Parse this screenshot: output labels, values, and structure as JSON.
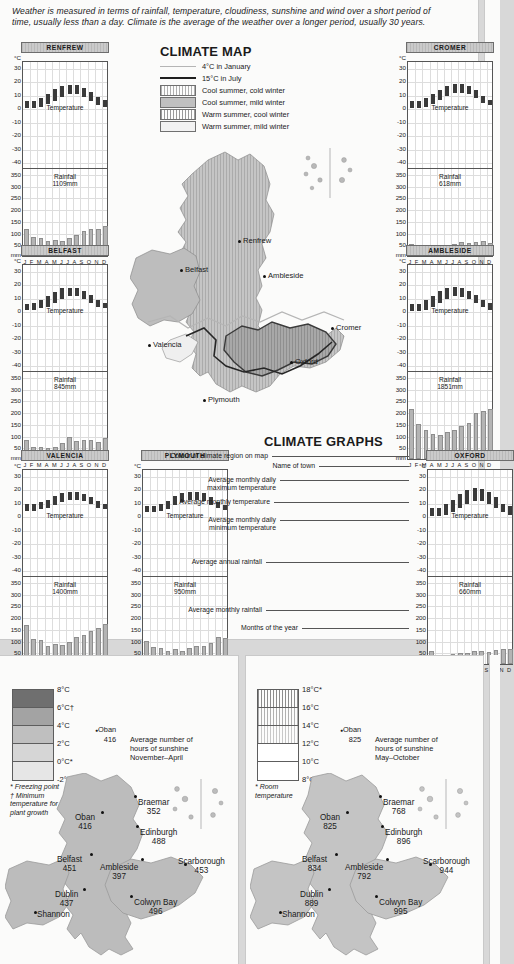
{
  "intro": "Weather is measured in terms of rainfall, temperature, cloudiness, sunshine and wind over a short period of time, usually less than a day. Climate is the average of the weather over a longer period, usually 30 years.",
  "sections": {
    "climate_map": "CLIMATE MAP",
    "climate_graphs": "CLIMATE GRAPHS"
  },
  "key": {
    "lines": [
      {
        "label": "4°C in January",
        "color": "#b5b5b5",
        "weight": 1
      },
      {
        "label": "15°C in July",
        "color": "#1f1f1f",
        "weight": 2
      }
    ],
    "swatches": [
      {
        "label": "Cool summer, cold winter",
        "color": "#b0b0b0",
        "hatch": true
      },
      {
        "label": "Cool summer, mild winter",
        "color": "#c0c0c0",
        "hatch": false
      },
      {
        "label": "Warm summer, cool winter",
        "color": "#9a9a9a",
        "hatch": true
      },
      {
        "label": "Warm summer, mild winter",
        "color": "#f2f2f2",
        "hatch": false
      }
    ]
  },
  "map_cities": [
    {
      "name": "Renfrew",
      "x": 108,
      "y": 98
    },
    {
      "name": "Belfast",
      "x": 50,
      "y": 127
    },
    {
      "name": "Ambleside",
      "x": 133,
      "y": 133
    },
    {
      "name": "Cromer",
      "x": 201,
      "y": 185
    },
    {
      "name": "Valencia",
      "x": 18,
      "y": 202
    },
    {
      "name": "Oxford",
      "x": 160,
      "y": 219
    },
    {
      "name": "Plymouth",
      "x": 73,
      "y": 257
    }
  ],
  "graph_axis": {
    "temp_unit": "°C",
    "temp_ticks": [
      "30",
      "20",
      "10",
      "0",
      "-10",
      "-20",
      "-30",
      "-40"
    ],
    "rain_unit": "mm",
    "rain_ticks": [
      "350",
      "300",
      "250",
      "200",
      "150",
      "100",
      "50"
    ],
    "months": [
      "J",
      "F",
      "M",
      "A",
      "M",
      "J",
      "J",
      "A",
      "S",
      "O",
      "N",
      "D"
    ],
    "temp_caption": "Temperature",
    "rain_caption": "Rainfall"
  },
  "annotations": [
    {
      "text": "Colour of climate region on map",
      "x": 268,
      "y": 452
    },
    {
      "text": "Name of town",
      "x": 315,
      "y": 462
    },
    {
      "text": "Average monthly daily\nmaximum temperature",
      "x": 276,
      "y": 476
    },
    {
      "text": "Average monthly temperature",
      "x": 270,
      "y": 498
    },
    {
      "text": "Average monthly daily\nminimum temperature",
      "x": 276,
      "y": 516
    },
    {
      "text": "Average annual rainfall",
      "x": 262,
      "y": 558
    },
    {
      "text": "Average monthly rainfall",
      "x": 262,
      "y": 606
    },
    {
      "text": "Months of the year",
      "x": 298,
      "y": 624
    }
  ],
  "chart_data": [
    {
      "type": "bar",
      "title": "RENFREW",
      "x": 5,
      "y": 42,
      "categories": [
        "J",
        "F",
        "M",
        "A",
        "M",
        "J",
        "J",
        "A",
        "S",
        "O",
        "N",
        "D"
      ],
      "ylabel": "°C",
      "ylim": [
        -45,
        35
      ],
      "rain_ylim": [
        0,
        375
      ],
      "rain_ylabel": "mm",
      "annual_rainfall_label": "1109mm",
      "annual_rainfall": 1109,
      "temp_min": [
        1,
        1,
        2,
        4,
        6,
        9,
        11,
        11,
        9,
        6,
        3,
        2
      ],
      "temp_max": [
        6,
        6,
        8,
        11,
        15,
        17,
        18,
        18,
        16,
        13,
        9,
        7
      ],
      "rainfall": [
        115,
        80,
        75,
        63,
        68,
        66,
        78,
        90,
        105,
        113,
        117,
        127
      ]
    },
    {
      "type": "bar",
      "title": "CROMER",
      "x": 390,
      "y": 42,
      "categories": [
        "J",
        "F",
        "M",
        "A",
        "M",
        "J",
        "J",
        "A",
        "S",
        "O",
        "N",
        "D"
      ],
      "ylabel": "°C",
      "ylim": [
        -45,
        35
      ],
      "rain_ylim": [
        0,
        375
      ],
      "rain_ylabel": "mm",
      "annual_rainfall_label": "618mm",
      "annual_rainfall": 618,
      "temp_min": [
        1,
        1,
        2,
        4,
        7,
        10,
        12,
        12,
        11,
        8,
        5,
        3
      ],
      "temp_max": [
        6,
        6,
        8,
        11,
        14,
        17,
        19,
        19,
        17,
        14,
        10,
        7
      ],
      "rainfall": [
        52,
        40,
        38,
        39,
        41,
        44,
        52,
        58,
        56,
        58,
        62,
        56
      ]
    },
    {
      "type": "bar",
      "title": "BELFAST",
      "x": 5,
      "y": 245,
      "categories": [
        "J",
        "F",
        "M",
        "A",
        "M",
        "J",
        "J",
        "A",
        "S",
        "O",
        "N",
        "D"
      ],
      "ylabel": "°C",
      "ylim": [
        -45,
        35
      ],
      "rain_ylim": [
        0,
        375
      ],
      "rain_ylabel": "mm",
      "annual_rainfall_label": "845mm",
      "annual_rainfall": 845,
      "temp_min": [
        2,
        2,
        3,
        4,
        7,
        10,
        12,
        12,
        10,
        7,
        4,
        3
      ],
      "temp_max": [
        6,
        7,
        9,
        12,
        15,
        18,
        18,
        18,
        16,
        13,
        9,
        7
      ],
      "rainfall": [
        80,
        52,
        50,
        48,
        52,
        68,
        94,
        77,
        80,
        83,
        72,
        90
      ]
    },
    {
      "type": "bar",
      "title": "AMBLESIDE",
      "x": 390,
      "y": 245,
      "categories": [
        "J",
        "F",
        "M",
        "A",
        "M",
        "J",
        "J",
        "A",
        "S",
        "O",
        "N",
        "D"
      ],
      "ylabel": "°C",
      "ylim": [
        -45,
        35
      ],
      "rain_ylim": [
        0,
        375
      ],
      "rain_ylabel": "mm",
      "annual_rainfall_label": "1851mm",
      "annual_rainfall": 1851,
      "temp_min": [
        1,
        1,
        2,
        4,
        7,
        10,
        12,
        11,
        10,
        7,
        4,
        2
      ],
      "temp_max": [
        6,
        6,
        9,
        12,
        16,
        18,
        19,
        18,
        16,
        13,
        9,
        7
      ],
      "rainfall": [
        215,
        148,
        123,
        105,
        103,
        113,
        125,
        140,
        153,
        196,
        205,
        212
      ]
    },
    {
      "type": "bar",
      "title": "VALENCIA",
      "x": 5,
      "y": 450,
      "categories": [
        "J",
        "F",
        "M",
        "A",
        "M",
        "J",
        "J",
        "A",
        "S",
        "O",
        "N",
        "D"
      ],
      "ylabel": "°C",
      "ylim": [
        -45,
        35
      ],
      "rain_ylim": [
        0,
        375
      ],
      "rain_ylabel": "mm",
      "annual_rainfall_label": "1400mm",
      "annual_rainfall": 1400,
      "temp_min": [
        5,
        5,
        6,
        7,
        9,
        11,
        13,
        13,
        12,
        10,
        7,
        6
      ],
      "temp_max": [
        10,
        10,
        11,
        13,
        16,
        18,
        19,
        19,
        17,
        15,
        12,
        10
      ],
      "rainfall": [
        167,
        107,
        103,
        75,
        86,
        81,
        95,
        114,
        125,
        141,
        152,
        170
      ]
    },
    {
      "type": "bar",
      "title": "PLYMOUTH",
      "x": 125,
      "y": 450,
      "categories": [
        "J",
        "F",
        "M",
        "A",
        "M",
        "J",
        "J",
        "A",
        "S",
        "O",
        "N",
        "D"
      ],
      "ylabel": "°C",
      "ylim": [
        -45,
        35
      ],
      "rain_ylim": [
        0,
        375
      ],
      "rain_ylabel": "mm",
      "annual_rainfall_label": "950mm",
      "annual_rainfall": 950,
      "temp_min": [
        4,
        4,
        5,
        6,
        9,
        11,
        13,
        13,
        12,
        9,
        7,
        5
      ],
      "temp_max": [
        8,
        8,
        10,
        12,
        16,
        18,
        19,
        19,
        18,
        15,
        11,
        9
      ],
      "rainfall": [
        99,
        74,
        69,
        54,
        63,
        55,
        70,
        77,
        78,
        91,
        113,
        110
      ]
    },
    {
      "type": "bar",
      "title": "OXFORD",
      "x": 410,
      "y": 450,
      "categories": [
        "J",
        "F",
        "M",
        "A",
        "M",
        "J",
        "J",
        "A",
        "S",
        "O",
        "N",
        "D"
      ],
      "ylabel": "°C",
      "ylim": [
        -45,
        35
      ],
      "rain_ylim": [
        0,
        375
      ],
      "rain_ylabel": "mm",
      "annual_rainfall_label": "660mm",
      "annual_rainfall": 660,
      "temp_min": [
        1,
        1,
        2,
        4,
        7,
        10,
        12,
        12,
        10,
        7,
        4,
        2
      ],
      "temp_max": [
        7,
        7,
        10,
        13,
        17,
        20,
        22,
        21,
        19,
        15,
        10,
        8
      ],
      "rainfall": [
        54,
        40,
        40,
        41,
        45,
        48,
        55,
        55,
        53,
        60,
        62,
        65
      ]
    }
  ],
  "january_panel": {
    "title": "JANUARY\nTEMPERATURE",
    "key_title": "Average monthly\ntemperature",
    "scale_labels": [
      "8°C",
      "6°C†",
      "4°C",
      "2°C",
      "0°C*",
      "-2°C"
    ],
    "scale_colors": [
      "#6f6f6f",
      "#a3a3a3",
      "#bfbfbf",
      "#d6d6d6",
      "#e6e6e6"
    ],
    "notes": "* Freezing point\n† Minimum\ntemperature for\nplant growth",
    "sun_example_city": "Oban",
    "sun_example_value": "416",
    "sun_caption": "Average number of\nhours of sunshine\nNovember–April",
    "cities": [
      {
        "name": "Braemar",
        "value": "352",
        "x": 138,
        "y": 143,
        "dx": 134,
        "dy": 140
      },
      {
        "name": "Oban",
        "value": "416",
        "x": 75,
        "y": 158,
        "dx": 101,
        "dy": 156
      },
      {
        "name": "Edinburgh",
        "value": "488",
        "x": 140,
        "y": 173,
        "dx": 136,
        "dy": 170
      },
      {
        "name": "Belfast",
        "value": "451",
        "x": 57,
        "y": 200,
        "dx": 90,
        "dy": 198
      },
      {
        "name": "Ambleside",
        "value": "397",
        "x": 100,
        "y": 208,
        "dx": 141,
        "dy": 203
      },
      {
        "name": "Scarborough",
        "value": "453",
        "x": 178,
        "y": 202,
        "dx": 184,
        "dy": 208
      },
      {
        "name": "Dublin",
        "value": "437",
        "x": 55,
        "y": 235,
        "dx": 83,
        "dy": 233
      },
      {
        "name": "Colwyn Bay",
        "value": "496",
        "x": 134,
        "y": 243,
        "dx": 130,
        "dy": 240
      },
      {
        "name": "Shannon",
        "value": "",
        "x": 37,
        "y": 255,
        "dx": 34,
        "dy": 256
      }
    ]
  },
  "july_panel": {
    "title": "JULY\nTEMPERATURE",
    "key_title": "Average monthly\ntemperature",
    "scale_labels": [
      "18°C*",
      "16°C",
      "14°C",
      "12°C",
      "10°C",
      "8°C"
    ],
    "scale_colors": [
      "#8c8c8c",
      "#b0b0b0",
      "#c8c8c8",
      "#ffffff",
      "#ffffff"
    ],
    "notes": "* Room\ntemperature",
    "sun_example_city": "Oban",
    "sun_example_value": "825",
    "sun_caption": "Average number of\nhours of sunshine\nMay–October",
    "cities": [
      {
        "name": "Braemar",
        "value": "768",
        "x": 138,
        "y": 143,
        "dx": 134,
        "dy": 140
      },
      {
        "name": "Oban",
        "value": "825",
        "x": 75,
        "y": 158,
        "dx": 101,
        "dy": 156
      },
      {
        "name": "Edinburgh",
        "value": "896",
        "x": 140,
        "y": 173,
        "dx": 136,
        "dy": 170
      },
      {
        "name": "Belfast",
        "value": "834",
        "x": 57,
        "y": 200,
        "dx": 90,
        "dy": 198
      },
      {
        "name": "Ambleside",
        "value": "792",
        "x": 100,
        "y": 208,
        "dx": 141,
        "dy": 203
      },
      {
        "name": "Scarborough",
        "value": "944",
        "x": 178,
        "y": 202,
        "dx": 184,
        "dy": 208
      },
      {
        "name": "Dublin",
        "value": "889",
        "x": 55,
        "y": 235,
        "dx": 83,
        "dy": 233
      },
      {
        "name": "Colwyn Bay",
        "value": "995",
        "x": 134,
        "y": 243,
        "dx": 130,
        "dy": 240
      },
      {
        "name": "Shannon",
        "value": "",
        "x": 37,
        "y": 255,
        "dx": 34,
        "dy": 256
      }
    ]
  }
}
